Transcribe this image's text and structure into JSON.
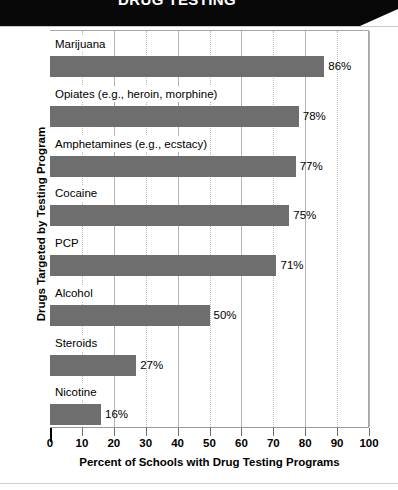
{
  "banner": {
    "title": "DRUG TESTING",
    "background_color": "#080808",
    "text_color": "#ffffff"
  },
  "chart_data": {
    "type": "bar",
    "orientation": "horizontal",
    "title": "",
    "xlabel": "Percent of Schools with Drug Testing Programs",
    "ylabel": "Drugs Targeted by Testing Program",
    "xlim": [
      0,
      100
    ],
    "xticks": [
      0,
      10,
      20,
      30,
      40,
      50,
      60,
      70,
      80,
      90,
      100
    ],
    "xtick_labels": [
      "0",
      "10",
      "20",
      "30",
      "40",
      "50",
      "60",
      "70",
      "80",
      "90",
      "100"
    ],
    "grid": "vertical",
    "legend": "none",
    "bar_color": "#6e6e6e",
    "categories": [
      "Marijuana",
      "Opiates (e.g., heroin, morphine)",
      "Amphetamines (e.g., ecstacy)",
      "Cocaine",
      "PCP",
      "Alcohol",
      "Steroids",
      "Nicotine"
    ],
    "values": [
      86,
      78,
      77,
      75,
      71,
      50,
      27,
      16
    ],
    "value_labels": [
      "86%",
      "78%",
      "77%",
      "75%",
      "71%",
      "50%",
      "27%",
      "16%"
    ]
  }
}
